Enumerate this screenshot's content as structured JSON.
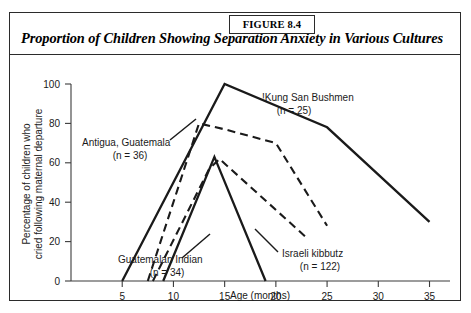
{
  "figure": {
    "tag": "FIGURE 8.4",
    "title": "Proportion of Children Showing Separation Anxiety in Various Cultures"
  },
  "chart_data": {
    "type": "line",
    "title": "Proportion of Children Showing Separation Anxiety in Various Cultures",
    "xlabel": "Age (months)",
    "ylabel": "Percentage of children who cried following maternal departure",
    "xlim": [
      0,
      37
    ],
    "ylim": [
      0,
      100
    ],
    "xticks": [
      5,
      10,
      15,
      20,
      25,
      30,
      35
    ],
    "yticks": [
      0,
      20,
      40,
      60,
      80,
      100
    ],
    "grid": false,
    "legend_position": "inline-annotations",
    "series": [
      {
        "name": "!Kung San Bushmen",
        "n_label": "(n = 25)",
        "n": 25,
        "style": "solid",
        "x": [
          5,
          15,
          25,
          35
        ],
        "y": [
          0,
          100,
          78,
          30
        ]
      },
      {
        "name": "Antigua, Guatemala",
        "n_label": "(n = 36)",
        "n": 36,
        "style": "dashed",
        "x": [
          7.5,
          12.5,
          15,
          20,
          25
        ],
        "y": [
          0,
          80,
          77,
          70,
          28
        ]
      },
      {
        "name": "Guatemalan Indian",
        "n_label": "(n = 34)",
        "n": 34,
        "style": "solid",
        "x": [
          9,
          14,
          19
        ],
        "y": [
          0,
          63,
          0
        ]
      },
      {
        "name": "Israeli kibbutz",
        "n_label": "(n = 122)",
        "n": 122,
        "style": "dashed",
        "x": [
          8,
          13.5,
          14.5,
          23
        ],
        "y": [
          0,
          57,
          62,
          22
        ]
      }
    ],
    "annotations": [
      {
        "label": "!Kung San Bushmen",
        "n_label": "(n = 25)"
      },
      {
        "label": "Antigua, Guatemala",
        "n_label": "(n = 36)"
      },
      {
        "label": "Guatemalan Indian",
        "n_label": "(n = 34)"
      },
      {
        "label": "Israeli kibbutz",
        "n_label": "(n = 122)"
      }
    ]
  }
}
